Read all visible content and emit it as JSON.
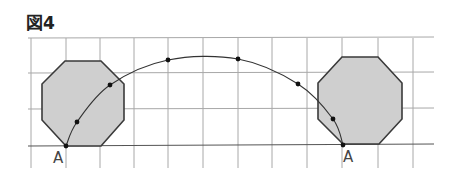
{
  "figure": {
    "title": "図4",
    "grid": {
      "x_lines": [
        31,
        66,
        100,
        134,
        168,
        203,
        238,
        272,
        307,
        342,
        378,
        413
      ],
      "y_lines": [
        38,
        73,
        109,
        145
      ],
      "x_start": 28,
      "x_end": 434,
      "y_bottom": 168,
      "color": "#a8a8a8"
    },
    "octagons": [
      {
        "name": "start",
        "points": "65,61 101,61 124,84 124,120 101,146 66,146 42,120 42,84",
        "fill": "#cfcfcf"
      },
      {
        "name": "end",
        "points": "342,57 378,57 402,83 402,119 379,144 343,144 318,119 318,83",
        "fill": "#cfcfcf"
      }
    ],
    "path_points": [
      {
        "x": 66,
        "y": 146
      },
      {
        "x": 77,
        "y": 122
      },
      {
        "x": 110,
        "y": 85
      },
      {
        "x": 168,
        "y": 60
      },
      {
        "x": 238,
        "y": 59
      },
      {
        "x": 298,
        "y": 84
      },
      {
        "x": 333,
        "y": 119
      },
      {
        "x": 343,
        "y": 145
      }
    ],
    "labels": [
      {
        "text": "A",
        "x": 53,
        "y": 163
      },
      {
        "text": "A",
        "x": 343,
        "y": 162
      }
    ]
  }
}
